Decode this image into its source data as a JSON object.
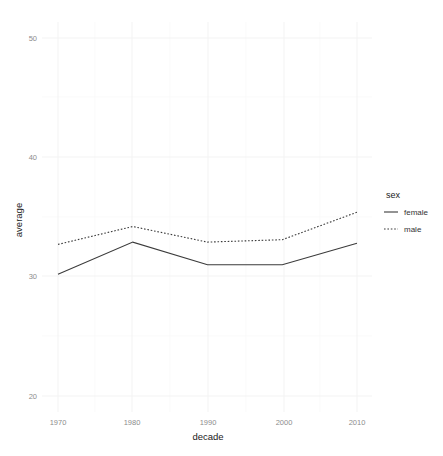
{
  "chart_data": {
    "type": "line",
    "title": "",
    "xlabel": "decade",
    "ylabel": "average",
    "x": [
      1970,
      1980,
      1990,
      2000,
      2010
    ],
    "xticklabels": [
      "1970",
      "1980",
      "1990",
      "2000",
      "2010"
    ],
    "yticklabels": [
      "20",
      "30",
      "40",
      "50"
    ],
    "yticks": [
      20,
      30,
      40,
      50
    ],
    "xlim": [
      1965,
      2015
    ],
    "ylim": [
      17.5,
      52.5
    ],
    "grid": true,
    "legend_position": "right",
    "legend_title": "sex",
    "series": [
      {
        "name": "female",
        "linestyle": "solid",
        "color": "#3b3b3b",
        "values": [
          30.2,
          32.9,
          31.0,
          31.0,
          32.8
        ]
      },
      {
        "name": "male",
        "linestyle": "dotted",
        "color": "#3b3b3b",
        "values": [
          32.7,
          34.2,
          32.9,
          33.1,
          35.4
        ]
      }
    ]
  },
  "axes": {
    "y_title": "average",
    "x_title": "decade"
  },
  "legend": {
    "title": "sex",
    "items": [
      {
        "label": "female",
        "style": "solid-line-icon"
      },
      {
        "label": "male",
        "style": "dotted-line-icon"
      }
    ]
  },
  "colors": {
    "background": "#ffffff",
    "line": "#3b3b3b",
    "gridline_major": "#f2f2f2",
    "gridline_minor": "#f8f8f8",
    "tick_text": "#8c8c8c",
    "title_text": "#1a1a1a"
  }
}
